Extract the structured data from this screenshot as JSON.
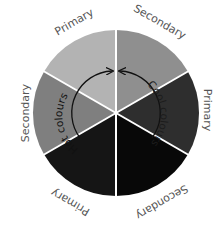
{
  "diagram": {
    "type": "colour-wheel",
    "center": [
      116,
      113
    ],
    "radius": 83,
    "segments": [
      {
        "name": "top-left",
        "label": "Primary",
        "color": "#b3b3b3"
      },
      {
        "name": "top-right",
        "label": "Secondary",
        "color": "#8f8f8f"
      },
      {
        "name": "right",
        "label": "Primary",
        "color": "#2e2e2e"
      },
      {
        "name": "bottom-right",
        "label": "Secondary",
        "color": "#080808"
      },
      {
        "name": "bottom-left",
        "label": "Primary",
        "color": "#151515"
      },
      {
        "name": "left",
        "label": "Secondary",
        "color": "#7f7f7f"
      }
    ],
    "arcs": {
      "hot": {
        "label": "Hot colours",
        "color": "#111111"
      },
      "cool": {
        "label": "Cool colours",
        "color": "#111111"
      }
    },
    "divider_color": "#ffffff"
  }
}
